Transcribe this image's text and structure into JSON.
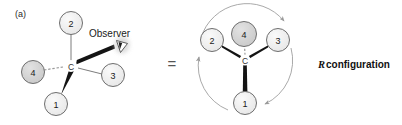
{
  "figure": {
    "panel_label": "(a)",
    "equals_symbol": "=",
    "observer_label": "Observer",
    "observer_icon": "eye-icon",
    "configuration_letter": "R",
    "configuration_word": "configuration",
    "center_atom_label": "C"
  },
  "colors": {
    "background": "#ffffff",
    "node_fill_light": "#ededed",
    "node_fill_dark": "#d2d2d2",
    "node_stroke": "#6e6e6e",
    "bond_thin": "#777777",
    "bond_wedge": "#111111",
    "bond_dashed": "#8a8a8a",
    "arc_arrow": "#9a9a9a",
    "text": "#1a1a1a"
  },
  "left_structure": {
    "name": "tetrahedral-3d-structure",
    "center": {
      "label": "C",
      "x": 71,
      "y": 66
    },
    "substituents": [
      {
        "label": "2",
        "x": 71,
        "y": 23,
        "r": 11.5,
        "shade": "light",
        "bond": "plain"
      },
      {
        "label": "4",
        "x": 33,
        "y": 72,
        "r": 11.5,
        "shade": "dark",
        "bond": "dashed"
      },
      {
        "label": "3",
        "x": 113,
        "y": 75,
        "r": 11.5,
        "shade": "light",
        "bond": "plain"
      },
      {
        "label": "1",
        "x": 56,
        "y": 104,
        "r": 11.5,
        "shade": "light",
        "bond": "wedge"
      }
    ],
    "observer_bond": {
      "from_x": 74,
      "from_y": 62,
      "to_x": 114,
      "to_y": 45,
      "bond": "wedge"
    },
    "observer_eye": {
      "x": 121,
      "y": 46
    }
  },
  "right_structure": {
    "name": "newman-priority-structure",
    "center": {
      "label": "C",
      "x": 245,
      "y": 60
    },
    "substituents": [
      {
        "label": "2",
        "x": 212,
        "y": 40,
        "r": 11.5,
        "shade": "light",
        "bond": "wedge"
      },
      {
        "label": "4",
        "x": 244,
        "y": 34,
        "r": 12.5,
        "shade": "dark",
        "bond": "dashed"
      },
      {
        "label": "3",
        "x": 278,
        "y": 40,
        "r": 11.5,
        "shade": "light",
        "bond": "wedge"
      },
      {
        "label": "1",
        "x": 245,
        "y": 103,
        "r": 11.5,
        "shade": "light",
        "bond": "wedge"
      }
    ],
    "rotation_arcs": [
      {
        "name": "arc-2-to-3",
        "direction": "clockwise",
        "arrowhead": "end"
      },
      {
        "name": "arc-3-to-1",
        "direction": "clockwise",
        "arrowhead": "end"
      },
      {
        "name": "arc-1-to-2",
        "direction": "clockwise",
        "arrowhead": "end"
      }
    ]
  },
  "layout": {
    "equals_x": 172,
    "equals_y": 63,
    "panel_label_x": 15,
    "panel_label_y": 14,
    "observer_text_x": 89,
    "observer_text_y": 33,
    "config_x": 318,
    "config_y": 64
  }
}
